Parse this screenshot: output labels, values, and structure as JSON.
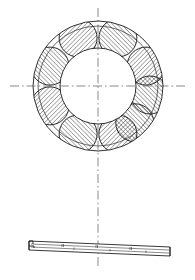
{
  "figure": {
    "caption": "",
    "views": [
      {
        "name": "plan-view",
        "label": ""
      },
      {
        "name": "section-view",
        "label": ""
      }
    ]
  },
  "geometry": {
    "center_x": 98,
    "center_y": 86,
    "outer_radius": 65,
    "mid_radius": 60,
    "bore_radius": 38,
    "pocket_count": 8,
    "pocket_orbit_radius": 52,
    "pocket_radius": 19,
    "pocket_start_angle_deg": 22.5,
    "hatch_angle_deg": 45
  },
  "section": {
    "left_x": 28,
    "right_x": 170,
    "left_y": 243,
    "right_y": 249,
    "thickness": 9
  },
  "centerlines": {
    "horizontal": {
      "x1": 10,
      "x2": 186,
      "y": 86
    },
    "vertical": {
      "x": 98,
      "y1": 8,
      "y2": 266
    }
  },
  "colors": {
    "line": "#1a1a1a",
    "centerline": "#55565a",
    "hatch": "#2a2a2a",
    "background": "#ffffff"
  }
}
